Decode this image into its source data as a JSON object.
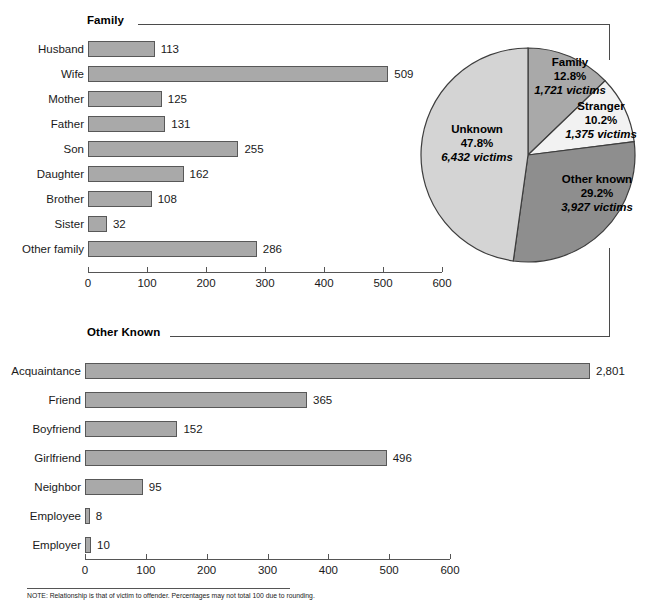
{
  "note": {
    "text": "NOTE: Relationship is that of victim to offender. Percentages may not total 100 due to rounding."
  },
  "sections": {
    "family_title": "Family",
    "other_known_title": "Other Known"
  },
  "colors": {
    "bar_fill": "#a9a9a9",
    "bar_stroke": "#585858",
    "pie_family": "#a9a9a9",
    "pie_stranger": "#f2f2f2",
    "pie_other_known": "#8e8e8e",
    "pie_unknown": "#d4d4d4",
    "rule": "#4b4b4b"
  },
  "chart_data": [
    {
      "type": "bar",
      "title": "Family",
      "orientation": "horizontal",
      "xlabel": "",
      "ylabel": "",
      "xlim": [
        0,
        600
      ],
      "ticks": [
        0,
        100,
        200,
        300,
        400,
        500,
        600
      ],
      "tick_labels": [
        "0",
        "100",
        "200",
        "300",
        "400",
        "500",
        "600"
      ],
      "grid": true,
      "categories": [
        "Husband",
        "Wife",
        "Mother",
        "Father",
        "Son",
        "Daughter",
        "Brother",
        "Sister",
        "Other family"
      ],
      "values": [
        113,
        509,
        125,
        131,
        255,
        162,
        108,
        32,
        286
      ],
      "value_labels": [
        "113",
        "509",
        "125",
        "131",
        "255",
        "162",
        "108",
        "32",
        "286"
      ]
    },
    {
      "type": "bar",
      "title": "Other Known",
      "orientation": "horizontal",
      "xlabel": "",
      "ylabel": "",
      "xlim": [
        0,
        600
      ],
      "ticks": [
        0,
        100,
        200,
        300,
        400,
        500,
        600
      ],
      "tick_labels": [
        "0",
        "100",
        "200",
        "300",
        "400",
        "500",
        "600"
      ],
      "grid": true,
      "categories": [
        "Acquaintance",
        "Friend",
        "Boyfriend",
        "Girlfriend",
        "Neighbor",
        "Employee",
        "Employer"
      ],
      "values": [
        2801,
        365,
        152,
        496,
        95,
        8,
        10
      ],
      "value_labels": [
        "2,801",
        "365",
        "152",
        "496",
        "95",
        "8",
        "10"
      ],
      "broken_axis_categories": [
        "Acquaintance"
      ],
      "broken_axis_note": "Acquaintance bar is drawn with an axis break; its true value 2,801 exceeds the 600 scale."
    },
    {
      "type": "pie",
      "title": "",
      "legend_position": "inside",
      "categories": [
        "Family",
        "Stranger",
        "Other known",
        "Unknown"
      ],
      "values": [
        12.8,
        10.2,
        29.2,
        47.8
      ],
      "counts": [
        1721,
        1375,
        3927,
        6432
      ],
      "slices": [
        {
          "label": "Family",
          "percent": "12.8%",
          "victims": "1,721 victims",
          "value": 12.8,
          "count": 1721,
          "color": "#a9a9a9"
        },
        {
          "label": "Stranger",
          "percent": "10.2%",
          "victims": "1,375 victims",
          "value": 10.2,
          "count": 1375,
          "color": "#f2f2f2"
        },
        {
          "label": "Other known",
          "percent": "29.2%",
          "victims": "3,927 victims",
          "value": 29.2,
          "count": 3927,
          "color": "#8e8e8e"
        },
        {
          "label": "Unknown",
          "percent": "47.8%",
          "victims": "6,432 victims",
          "value": 47.8,
          "count": 6432,
          "color": "#d4d4d4"
        }
      ]
    }
  ]
}
